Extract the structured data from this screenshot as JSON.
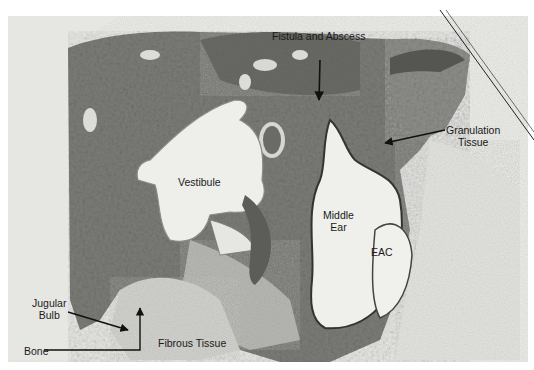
{
  "figure": {
    "type": "histology-micrograph",
    "colors": {
      "background": "#ffffff",
      "paper": "#eeeeea",
      "bone_dark": "#6e6e6a",
      "bone_mid": "#8a8a86",
      "soft_tissue": "#c8c8c4",
      "cavity": "#efefec",
      "annotation": "#111111"
    },
    "labels": {
      "fistula": "Fistula and Abscess",
      "granulation_line1": "Granulation",
      "granulation_line2": "Tissue",
      "vestibule": "Vestibule",
      "middle_ear_line1": "Middle",
      "middle_ear_line2": "Ear",
      "eac": "EAC",
      "jugular_line1": "Jugular",
      "jugular_line2": "Bulb",
      "bone": "Bone",
      "fibrous": "Fibrous Tissue"
    }
  }
}
